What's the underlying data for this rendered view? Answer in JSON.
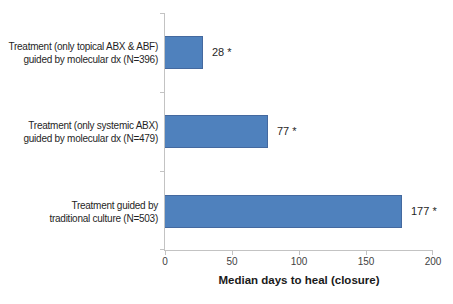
{
  "chart_data": {
    "type": "bar",
    "orientation": "horizontal",
    "title": "",
    "xlabel": "Median days to heal (closure)",
    "ylabel": "",
    "xlim": [
      0,
      200
    ],
    "x_ticks": [
      "0",
      "50",
      "100",
      "150",
      "200"
    ],
    "grid": false,
    "legend": "none",
    "bar_color": "#4F81BD",
    "bar_border_color": "#44699F",
    "axis_color": "#C3C3C3",
    "categories": [
      "Treatment (only topical ABX & ABF) guided by molecular dx (N=396)",
      "Treatment (only systemic ABX) guided by molecular dx (N=479)",
      "Treatment guided by traditional culture (N=503)"
    ],
    "category_lines": [
      [
        "Treatment (only topical ABX & ABF)",
        "guided by molecular dx (N=396)"
      ],
      [
        "Treatment (only systemic ABX)",
        "guided by molecular dx (N=479)"
      ],
      [
        "Treatment guided by",
        "traditional culture (N=503)"
      ]
    ],
    "values": [
      28,
      77,
      177
    ],
    "data_labels": [
      "28 *",
      "77 *",
      "177 *"
    ]
  }
}
